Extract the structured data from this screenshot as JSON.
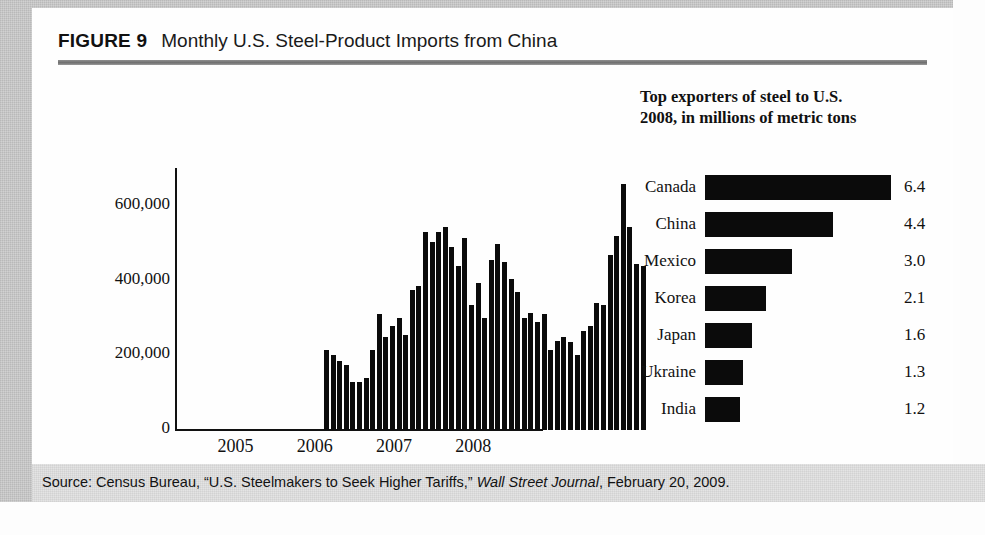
{
  "figure": {
    "label": "FIGURE 9",
    "title": "Monthly U.S. Steel-Product Imports from China",
    "source": {
      "prefix": "Source: Census Bureau, “U.S. Steelmakers to Seek Higher Tariffs,” ",
      "italic": "Wall Street Journal",
      "suffix": ", February 20, 2009."
    }
  },
  "right_panel": {
    "heading_line1": "Top exporters of steel to U.S.",
    "heading_line2": "2008, in millions of metric tons"
  },
  "colors": {
    "bar": "#0b0b0b",
    "panel_background": "#fefefe",
    "page_background": "#cdcdcd",
    "source_band": "#e2e2e2",
    "rule": "#7f7f7f"
  },
  "chart_data": [
    {
      "type": "bar",
      "title": "Monthly U.S. Steel-Product Imports from China",
      "xlabel": "",
      "ylabel": "",
      "ylim": [
        0,
        700000
      ],
      "yticks": [
        0,
        200000,
        400000,
        600000
      ],
      "ytick_labels": [
        "0",
        "200,000",
        "400,000",
        "600,000"
      ],
      "xtick_labels": [
        "2005",
        "2006",
        "2007",
        "2008"
      ],
      "xtick_positions": [
        6,
        18,
        30,
        42
      ],
      "grid": false,
      "legend": "none",
      "categories": [
        "2005-01",
        "2005-02",
        "2005-03",
        "2005-04",
        "2005-05",
        "2005-06",
        "2005-07",
        "2005-08",
        "2005-09",
        "2005-10",
        "2005-11",
        "2005-12",
        "2006-01",
        "2006-02",
        "2006-03",
        "2006-04",
        "2006-05",
        "2006-06",
        "2006-07",
        "2006-08",
        "2006-09",
        "2006-10",
        "2006-11",
        "2006-12",
        "2007-01",
        "2007-02",
        "2007-03",
        "2007-04",
        "2007-05",
        "2007-06",
        "2007-07",
        "2007-08",
        "2007-09",
        "2007-10",
        "2007-11",
        "2007-12",
        "2008-01",
        "2008-02",
        "2008-03",
        "2008-04",
        "2008-05",
        "2008-06",
        "2008-07",
        "2008-08",
        "2008-09",
        "2008-10",
        "2008-11",
        "2008-12",
        "2009-01"
      ],
      "values": [
        215000,
        200000,
        185000,
        175000,
        130000,
        130000,
        140000,
        215000,
        310000,
        250000,
        280000,
        300000,
        255000,
        375000,
        385000,
        530000,
        505000,
        530000,
        545000,
        490000,
        440000,
        515000,
        335000,
        395000,
        300000,
        455000,
        500000,
        450000,
        405000,
        370000,
        300000,
        315000,
        290000,
        310000,
        215000,
        240000,
        250000,
        235000,
        200000,
        265000,
        280000,
        340000,
        335000,
        470000,
        520000,
        660000,
        545000,
        445000,
        440000
      ]
    },
    {
      "type": "bar",
      "orientation": "horizontal",
      "title": "Top exporters of steel to U.S. 2008, in millions of metric tons",
      "xlabel": "millions of metric tons",
      "ylabel": "",
      "xlim": [
        0,
        6.4
      ],
      "grid": false,
      "legend": "none",
      "categories": [
        "Canada",
        "China",
        "Mexico",
        "Korea",
        "Japan",
        "Ukraine",
        "India"
      ],
      "values": [
        6.4,
        4.4,
        3.0,
        2.1,
        1.6,
        1.3,
        1.2
      ],
      "value_labels": [
        "6.4",
        "4.4",
        "3.0",
        "2.1",
        "1.6",
        "1.3",
        "1.2"
      ]
    }
  ]
}
